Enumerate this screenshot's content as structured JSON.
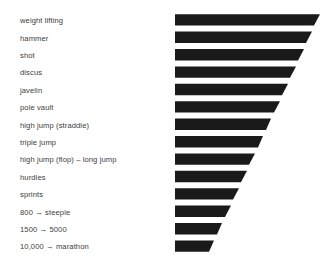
{
  "chart_data": {
    "type": "bar",
    "title": "",
    "subtitle": "",
    "xlabel": "",
    "ylabel": "",
    "orientation": "horizontal",
    "grid": false,
    "legend": null,
    "bar_color": "#1a1a1a",
    "background_color": "#ffffff",
    "label_color": "#3d3d3d",
    "shape_note": "each bar is a parallelogram whose right edge slants down-left, the fourteen right edges together form one continuous diagonal producing a wedge/funnel silhouette",
    "categories": [
      "weight lifting",
      "hammer",
      "shot",
      "discus",
      "javelin",
      "pole vault",
      "high jump (straddle)",
      "triple jump",
      "high jump (flop) – long jump",
      "hurdles",
      "sprints",
      "800 → steeple",
      "1500 → 5000",
      "10,000 → marathon"
    ],
    "values": [
      100,
      94,
      88,
      82,
      76,
      70,
      64,
      58,
      52,
      45,
      39,
      33,
      27,
      21
    ],
    "xlim": [
      0,
      100
    ],
    "values_note": "bar length in percent of the longest bar, read from the right-hand diagonal edge",
    "bar_top_right_px": [
      320,
      312,
      304,
      296,
      288,
      280,
      271,
      263,
      255,
      247,
      239,
      231,
      222,
      214
    ],
    "bar_bottom_right_px": [
      314,
      306,
      298,
      290,
      282,
      274,
      266,
      258,
      249,
      241,
      233,
      225,
      217,
      209
    ],
    "bar_left_px": 175
  },
  "labels": [
    {
      "text": "weight lifting"
    },
    {
      "text": "hammer"
    },
    {
      "text": "shot"
    },
    {
      "text": "discus"
    },
    {
      "text": "javelin"
    },
    {
      "text": "pole vault"
    },
    {
      "text": "high jump (straddle)"
    },
    {
      "text": "triple jump"
    },
    {
      "text": "high jump (flop) – long jump"
    },
    {
      "text": "hurdles"
    },
    {
      "text": "sprints"
    },
    {
      "text": "800 → steeple"
    },
    {
      "text": "1500 → 5000"
    },
    {
      "text": "10,000 → marathon"
    }
  ]
}
